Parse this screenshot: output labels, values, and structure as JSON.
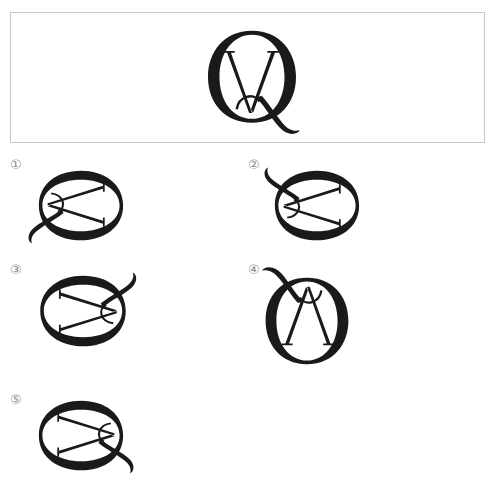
{
  "question": {
    "figure": "monogram-Q-with-V",
    "description": "Serif letter Q overlapping a V inside it"
  },
  "options": [
    {
      "marker": "①",
      "figure": "rotated-monogram-1"
    },
    {
      "marker": "②",
      "figure": "rotated-monogram-2"
    },
    {
      "marker": "③",
      "figure": "rotated-monogram-3"
    },
    {
      "marker": "④",
      "figure": "rotated-monogram-4"
    },
    {
      "marker": "⑤",
      "figure": "rotated-monogram-5"
    }
  ],
  "colors": {
    "ink": "#1a1a1a",
    "box_border": "#c8c8c8",
    "marker": "#8a8a8a"
  }
}
